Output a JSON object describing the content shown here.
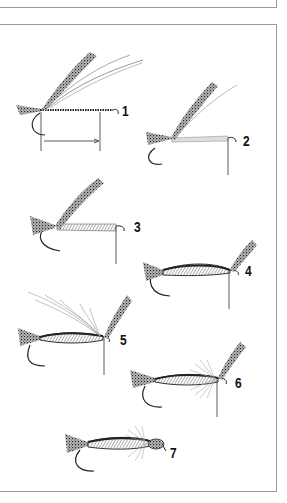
{
  "figure": {
    "type": "fly-tying step illustration",
    "steps": [
      {
        "label": "1",
        "description": "tail and wing material tied in at hook bend, thread wrapped, shank length marked"
      },
      {
        "label": "2",
        "description": "pale floss underbody added"
      },
      {
        "label": "3",
        "description": "hatched body wrapped forward"
      },
      {
        "label": "4",
        "description": "wing case folded forward, body complete"
      },
      {
        "label": "5",
        "description": "hackle feather tied in at thorax"
      },
      {
        "label": "6",
        "description": "hackle wound, wing case still up"
      },
      {
        "label": "7",
        "description": "finished fly with head"
      }
    ]
  },
  "colors": {
    "ink": "#222222",
    "frame": "#9a9a9a",
    "background": "#ffffff"
  }
}
